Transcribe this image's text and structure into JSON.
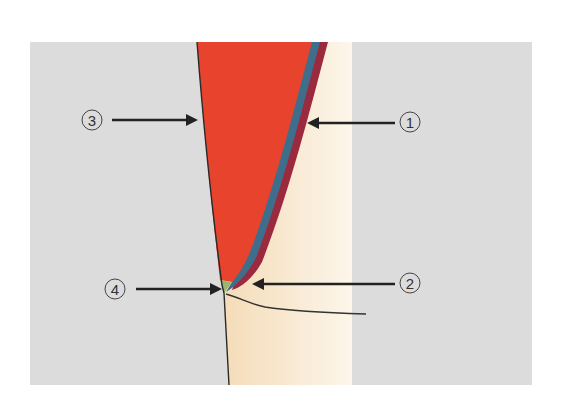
{
  "figure": {
    "type": "dental cross-section diagram",
    "colors": {
      "background": "#dcdcdc",
      "tooth": "#f7e6cc",
      "restoration": "#e8432c",
      "layer_blue": "#3f6e8c",
      "layer_maroon": "#9b2a3f",
      "green_wedge": "#9cb56a",
      "outline": "#2a2a2a"
    },
    "labels": [
      {
        "id": "1",
        "text": "①"
      },
      {
        "id": "2",
        "text": "②"
      },
      {
        "id": "3",
        "text": "③"
      },
      {
        "id": "4",
        "text": "④"
      }
    ]
  }
}
